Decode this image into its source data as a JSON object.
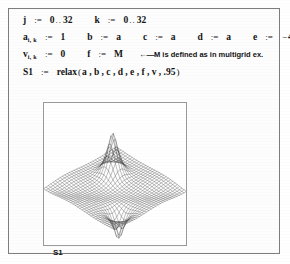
{
  "document": {
    "title": "Mathcad relaxation worksheet"
  },
  "math": {
    "line1": {
      "var_j": "j",
      "assign": ":=",
      "j_start": "0",
      "dots": "..",
      "j_end": "32",
      "var_k": "k",
      "k_start": "0",
      "k_end": "32"
    },
    "line2": {
      "var_a": "a",
      "a_sub": "i, k",
      "assign": ":=",
      "a_value": "1",
      "var_b": "b",
      "b_value": "a",
      "var_c": "c",
      "c_value": "a",
      "var_d": "d",
      "d_value": "a",
      "var_e": "e",
      "e_sign": "−",
      "e_coeff": "4",
      "e_dot": "·",
      "e_value": "a"
    },
    "line3": {
      "var_v": "v",
      "v_sub": "i, k",
      "assign": ":=",
      "v_value": "0",
      "var_f": "f",
      "f_value": "M",
      "arrow": "←—",
      "comment": "M is defined as in multigrid ex."
    },
    "line4": {
      "var_s1": "S1",
      "assign": ":=",
      "function": "relax",
      "open_paren": "(",
      "args": "a , b , c , d , e , f , v , .95",
      "close_paren": ")"
    }
  },
  "plot": {
    "label": "S1",
    "caption": "S1"
  },
  "chart_data": {
    "type": "surface",
    "title": "S1",
    "xlabel": "",
    "ylabel": "",
    "zlabel": "",
    "grid": "wireframe mesh",
    "mesh_n": 33,
    "features": [
      {
        "name": "positive-spike",
        "x": 0.68,
        "y": 0.72,
        "z": 1.0
      },
      {
        "name": "negative-spike",
        "x": 0.28,
        "y": 0.22,
        "z": -0.62
      },
      {
        "name": "saddle-ridge",
        "x": 0.5,
        "y": 0.5,
        "z": -0.08
      }
    ],
    "zlim": [
      -0.7,
      1.0
    ],
    "xlim": [
      0,
      32
    ],
    "ylim": [
      0,
      32
    ],
    "legend": "none"
  },
  "colors": {
    "frame": "#7d7d7d",
    "plot_frame": "#9a9a9a",
    "mesh": "#3a3a3a",
    "text": "#141414",
    "page_background": "#ffffff"
  }
}
